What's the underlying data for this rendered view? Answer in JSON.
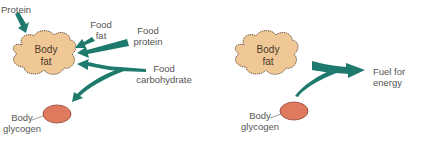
{
  "colors": {
    "arrow": "#1f7a6e",
    "fat_fill": "#f0c896",
    "fat_stroke": "#6b5440",
    "glycogen_fill": "#e07a5f",
    "glycogen_stroke": "#8a4030",
    "text": "#555555"
  },
  "left_panel": {
    "inputs": {
      "protein": "Protein",
      "food_fat_line1": "Food",
      "food_fat_line2": "fat",
      "food_protein_line1": "Food",
      "food_protein_line2": "protein",
      "food_carb_line1": "Food",
      "food_carb_line2": "carbohydrate"
    },
    "body_fat_line1": "Body",
    "body_fat_line2": "fat",
    "body_glycogen_line1": "Body",
    "body_glycogen_line2": "glycogen"
  },
  "right_panel": {
    "body_fat_line1": "Body",
    "body_fat_line2": "fat",
    "body_glycogen_line1": "Body",
    "body_glycogen_line2": "glycogen",
    "output": "Fuel for energy"
  }
}
